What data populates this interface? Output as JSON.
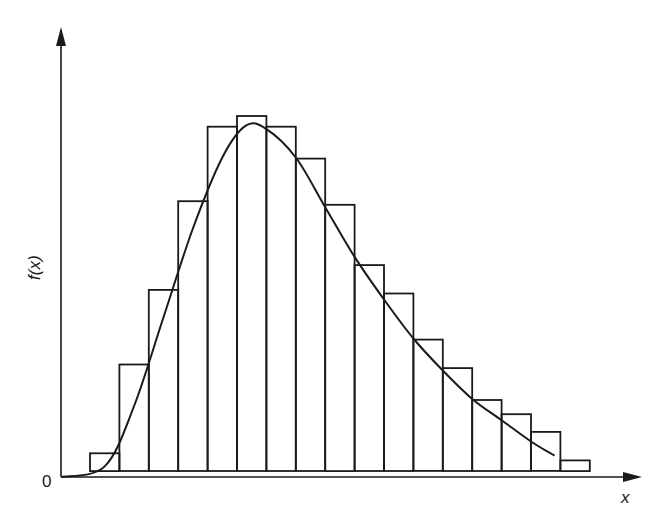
{
  "chart_data": {
    "type": "bar",
    "subtype": "histogram with fitted density curve",
    "title": "",
    "xlabel": "x",
    "ylabel": "f(x)",
    "origin_label": "0",
    "grid": false,
    "legend": null,
    "bin_count": 17,
    "bins": [
      1,
      2,
      3,
      4,
      5,
      6,
      7,
      8,
      9,
      10,
      11,
      12,
      13,
      14,
      15,
      16,
      17
    ],
    "values": [
      0.05,
      0.3,
      0.51,
      0.76,
      0.97,
      1.0,
      0.97,
      0.88,
      0.75,
      0.58,
      0.5,
      0.37,
      0.29,
      0.2,
      0.16,
      0.11,
      0.03
    ],
    "values_note": "relative bar heights normalized to tallest bar = 1.0 (no numeric y ticks shown)",
    "curve": {
      "description": "right-skewed smooth density curve (gamma-like), starting at origin, peaking near bin 6, tailing off near bin 16",
      "points": [
        [
          0,
          0.0
        ],
        [
          1,
          0.03
        ],
        [
          2,
          0.2
        ],
        [
          3,
          0.45
        ],
        [
          4,
          0.7
        ],
        [
          5,
          0.9
        ],
        [
          5.8,
          0.99
        ],
        [
          6.5,
          0.98
        ],
        [
          7.5,
          0.9
        ],
        [
          8.5,
          0.76
        ],
        [
          9.5,
          0.62
        ],
        [
          10.5,
          0.5
        ],
        [
          11.5,
          0.39
        ],
        [
          12.5,
          0.3
        ],
        [
          13.5,
          0.22
        ],
        [
          14.5,
          0.16
        ],
        [
          15.5,
          0.1
        ],
        [
          16.3,
          0.06
        ]
      ]
    },
    "colors": {
      "line": "#1a1a1a",
      "background": "#ffffff"
    }
  },
  "labels": {
    "y_axis": "f(x)",
    "x_axis": "x",
    "origin": "0"
  }
}
